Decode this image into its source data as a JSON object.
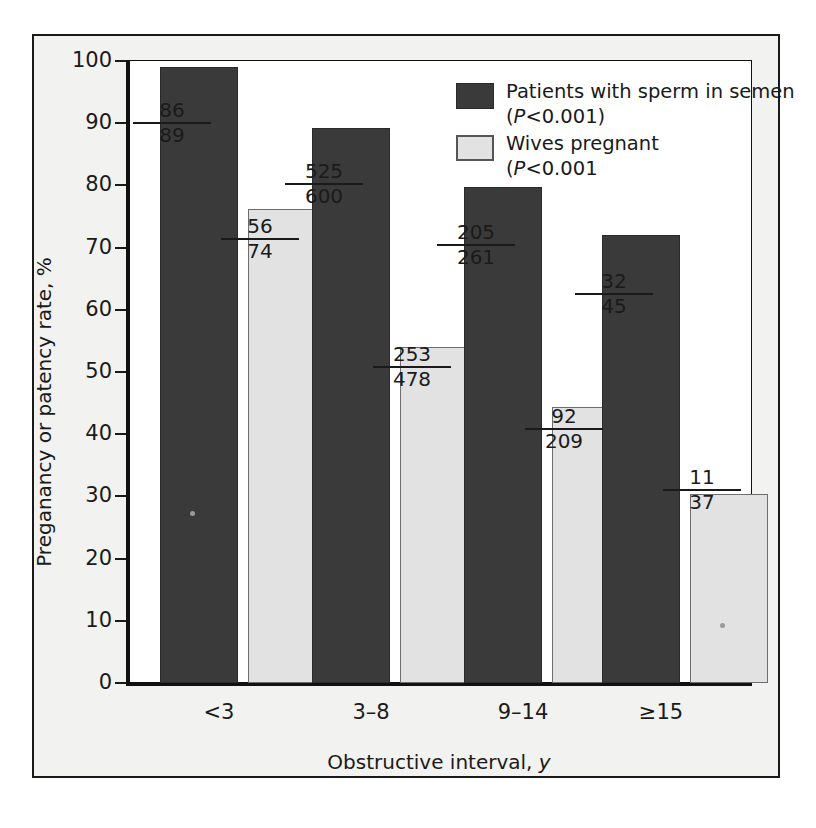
{
  "chart_data": {
    "type": "bar",
    "title": "",
    "xlabel": "Obstructive interval, y",
    "ylabel": "Preganancy or patency rate, %",
    "categories": [
      "<3",
      "3–8",
      "9–14",
      "≥15"
    ],
    "ylim": [
      0,
      100
    ],
    "yticks": [
      0,
      10,
      20,
      30,
      40,
      50,
      60,
      70,
      80,
      90,
      100
    ],
    "ytick_labels": [
      "0",
      "10",
      "20",
      "30",
      "40",
      "50",
      "60",
      "70",
      "80",
      "90",
      "100"
    ],
    "grid": false,
    "legend_position": "top-right",
    "series": [
      {
        "name": "Patients with sperm in semen",
        "pvalue": "(P<0.001)",
        "color": "#3a3a3a",
        "values": [
          99.0,
          89.2,
          79.8,
          72.0
        ],
        "labels": [
          {
            "numerator": "86",
            "denominator": "89"
          },
          {
            "numerator": "525",
            "denominator": "600"
          },
          {
            "numerator": "205",
            "denominator": "261"
          },
          {
            "numerator": "32",
            "denominator": "45"
          }
        ]
      },
      {
        "name": "Wives pregnant",
        "pvalue": "(P<0.001",
        "color": "#e2e2e2",
        "values": [
          76.2,
          54.1,
          44.4,
          30.4
        ],
        "labels": [
          {
            "numerator": "56",
            "denominator": "74"
          },
          {
            "numerator": "253",
            "denominator": "478"
          },
          {
            "numerator": "92",
            "denominator": "209"
          },
          {
            "numerator": "11",
            "denominator": "37"
          }
        ]
      }
    ]
  },
  "legend": {
    "items": [
      {
        "label": "Patients with sperm in semen",
        "pvalue_prefix": "(",
        "pvalue_italic": "P",
        "pvalue_rest": "<0.001)"
      },
      {
        "label": "Wives pregnant",
        "pvalue_prefix": "(",
        "pvalue_italic": "P",
        "pvalue_rest": "<0.001"
      }
    ]
  },
  "axes": {
    "y_title": "Preganancy or patency rate, %",
    "x_title_main": "Obstructive interval, ",
    "x_title_italic": "y"
  }
}
